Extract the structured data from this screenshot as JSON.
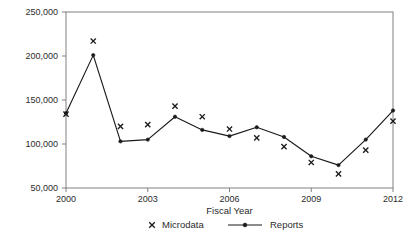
{
  "chart_data": {
    "type": "line",
    "title": "",
    "subtitle": "",
    "xlabel": "Fiscal Year",
    "ylabel": "",
    "x": [
      2000,
      2001,
      2002,
      2003,
      2004,
      2005,
      2006,
      2007,
      2008,
      2009,
      2010,
      2011,
      2012
    ],
    "categories": [
      "2000",
      "2001",
      "2002",
      "2003",
      "2004",
      "2005",
      "2006",
      "2007",
      "2008",
      "2009",
      "2010",
      "2011",
      "2012"
    ],
    "series": [
      {
        "name": "Microdata",
        "marker": "x",
        "line": false,
        "values": [
          134000,
          217000,
          120000,
          122000,
          143000,
          131000,
          117000,
          107000,
          97000,
          79000,
          66000,
          93000,
          126000
        ]
      },
      {
        "name": "Reports",
        "marker": "filled-circle",
        "line": true,
        "values": [
          135000,
          201000,
          103000,
          105000,
          131000,
          116000,
          109000,
          119000,
          108000,
          86000,
          76000,
          105000,
          138000
        ]
      }
    ],
    "xlim": [
      2000,
      2012
    ],
    "ylim": [
      50000,
      250000
    ],
    "xticks": [
      2000,
      2003,
      2006,
      2009,
      2012
    ],
    "xtick_labels": [
      "2000",
      "2003",
      "2006",
      "2009",
      "2012"
    ],
    "yticks": [
      50000,
      100000,
      150000,
      200000,
      250000
    ],
    "ytick_labels": [
      "50,000",
      "100,000",
      "150,000",
      "200,000",
      "250,000"
    ],
    "grid": false,
    "legend_position": "bottom",
    "colors": {
      "line": "#1a1a1a",
      "marker": "#1a1a1a",
      "axis": "#808080",
      "text": "#2b2b2b",
      "background": "#ffffff"
    }
  },
  "legend": {
    "entries": [
      {
        "label": "Microdata",
        "symbol": "x"
      },
      {
        "label": "Reports",
        "symbol": "line-dot"
      }
    ]
  },
  "axes": {
    "x_title": "Fiscal Year"
  }
}
